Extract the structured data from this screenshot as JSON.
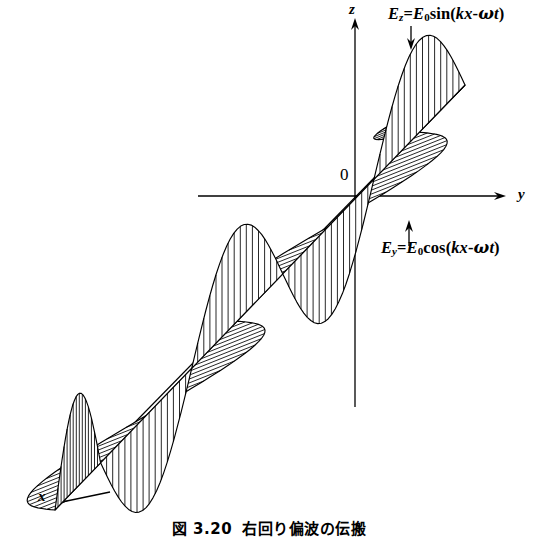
{
  "figure": {
    "kind": "physics-diagram",
    "background_color": "#ffffff",
    "line_color": "#000000"
  },
  "axes": {
    "z_label": "z",
    "y_label": "y",
    "x_label": "x",
    "origin_label": "0"
  },
  "annotations": {
    "ez": {
      "component": "E",
      "sub": "z",
      "equals": "=",
      "amp": "E",
      "amp_sub": "0",
      "fn": "sin",
      "open": "(",
      "k": "k",
      "x": "x",
      "minus": "-",
      "omega": "ω",
      "t": "t",
      "close": ")",
      "plain": "Ez = E0sin(kx-ωt)"
    },
    "ey": {
      "component": "E",
      "sub": "y",
      "equals": "=",
      "amp": "E",
      "amp_sub": "0",
      "fn": "cos",
      "open": "(",
      "k": "k",
      "x": "x",
      "minus": "-",
      "omega": "ω",
      "t": "t",
      "close": ")",
      "plain": "Ey = E0cos(kx-ωt)"
    }
  },
  "caption": {
    "number": "図 3.20",
    "title": "右回り偏波の伝搬"
  },
  "chart_data": {
    "type": "line",
    "title": "右回り偏波の伝搬",
    "series": [
      {
        "name": "Ez = E0sin(kx-ωt)",
        "hatch": "vertical",
        "phase_deg": 0,
        "amplitude": 1.0
      },
      {
        "name": "Ey = E0cos(kx-ωt)",
        "hatch": "horizontal",
        "phase_deg": 90,
        "amplitude": 1.0
      }
    ],
    "cycles": 2.25,
    "axis_start": [
      55,
      510
    ],
    "axis_end": [
      465,
      85
    ]
  }
}
